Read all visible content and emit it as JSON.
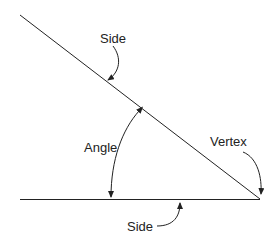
{
  "diagram": {
    "labels": {
      "side_top": "Side",
      "angle": "Angle",
      "vertex": "Vertex",
      "side_bottom": "Side"
    },
    "colors": {
      "line": "#222222",
      "background": "#ffffff"
    }
  }
}
